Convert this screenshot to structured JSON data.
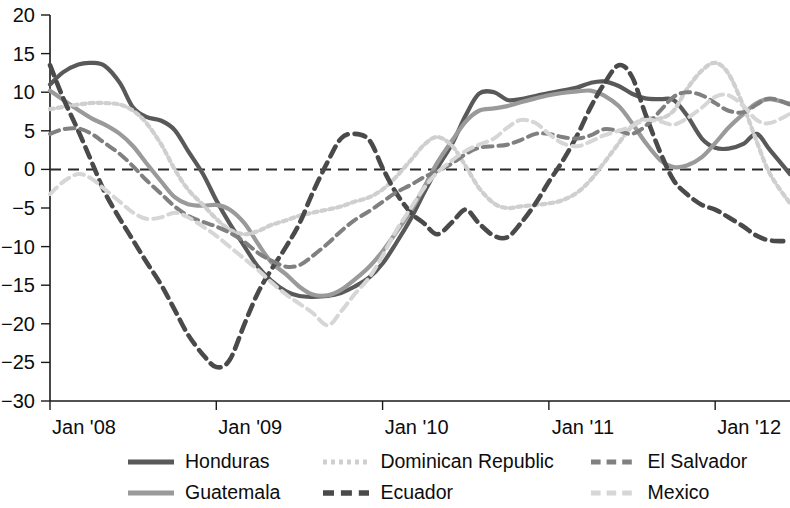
{
  "chart_data": {
    "type": "line",
    "title": "",
    "subtitle": "",
    "xlabel": "",
    "ylabel": "",
    "xlim": [
      2008.0,
      2012.45
    ],
    "ylim": [
      -30,
      20
    ],
    "x_tick_labels": [
      "Jan '08",
      "Jan '09",
      "Jan '10",
      "Jan '11",
      "Jan '12"
    ],
    "x_tick_values": [
      2008,
      2009,
      2010,
      2011,
      2012
    ],
    "y_tick_labels": [
      "20",
      "15",
      "10",
      "5",
      "0",
      "-5",
      "-10",
      "-15",
      "-20",
      "-25",
      "-30"
    ],
    "y_tick_values": [
      20,
      15,
      10,
      5,
      0,
      -5,
      -10,
      -15,
      -20,
      -25,
      -30
    ],
    "grid": false,
    "zero_reference_line": 0,
    "legend_position": "bottom",
    "series": [
      {
        "name": "Honduras",
        "color": "#595959",
        "style": "solid",
        "width": 4.2,
        "x": [
          2008.0,
          2008.08,
          2008.17,
          2008.25,
          2008.33,
          2008.42,
          2008.5,
          2008.58,
          2008.67,
          2008.75,
          2008.83,
          2008.92,
          2009.0,
          2009.08,
          2009.17,
          2009.25,
          2009.33,
          2009.42,
          2009.5,
          2009.58,
          2009.67,
          2009.75,
          2009.83,
          2009.92,
          2010.0,
          2010.08,
          2010.17,
          2010.25,
          2010.33,
          2010.42,
          2010.5,
          2010.58,
          2010.67,
          2010.75,
          2010.83,
          2010.92,
          2011.0,
          2011.08,
          2011.17,
          2011.25,
          2011.33,
          2011.42,
          2011.5,
          2011.58,
          2011.67,
          2011.75,
          2011.83,
          2011.92,
          2012.0,
          2012.08,
          2012.17,
          2012.25,
          2012.33,
          2012.45
        ],
        "values": [
          11.0,
          12.6,
          13.6,
          13.8,
          13.4,
          11.2,
          8.0,
          6.8,
          6.3,
          5.1,
          2.4,
          -0.6,
          -4.0,
          -7.0,
          -10.0,
          -12.6,
          -14.4,
          -15.8,
          -16.4,
          -16.5,
          -16.4,
          -16.0,
          -15.2,
          -14.0,
          -12.2,
          -9.6,
          -6.4,
          -3.0,
          0.2,
          3.4,
          7.0,
          9.8,
          10.0,
          9.0,
          9.1,
          9.5,
          9.9,
          10.2,
          10.6,
          11.2,
          11.4,
          10.8,
          9.8,
          9.2,
          9.1,
          9.0,
          7.0,
          4.0,
          2.8,
          2.7,
          3.3,
          4.6,
          2.5,
          -0.6
        ]
      },
      {
        "name": "Guatemala",
        "color": "#9a9a9a",
        "style": "solid",
        "width": 4.2,
        "x": [
          2008.0,
          2008.08,
          2008.17,
          2008.25,
          2008.33,
          2008.42,
          2008.5,
          2008.58,
          2008.67,
          2008.75,
          2008.83,
          2008.92,
          2009.0,
          2009.08,
          2009.17,
          2009.25,
          2009.33,
          2009.42,
          2009.5,
          2009.58,
          2009.67,
          2009.75,
          2009.83,
          2009.92,
          2010.0,
          2010.08,
          2010.17,
          2010.25,
          2010.33,
          2010.42,
          2010.5,
          2010.58,
          2010.67,
          2010.75,
          2010.83,
          2010.92,
          2011.0,
          2011.08,
          2011.17,
          2011.25,
          2011.33,
          2011.42,
          2011.5,
          2011.58,
          2011.67,
          2011.75,
          2011.83,
          2011.92,
          2012.0,
          2012.08,
          2012.17,
          2012.25,
          2012.33,
          2012.45
        ],
        "values": [
          10.2,
          9.0,
          7.7,
          6.6,
          5.8,
          4.6,
          3.0,
          0.8,
          -1.6,
          -3.6,
          -4.5,
          -4.7,
          -4.6,
          -5.2,
          -7.0,
          -9.6,
          -12.0,
          -13.6,
          -15.2,
          -16.2,
          -16.3,
          -15.6,
          -14.3,
          -12.6,
          -10.6,
          -8.2,
          -5.4,
          -2.3,
          0.9,
          3.8,
          6.2,
          7.6,
          7.9,
          8.2,
          8.7,
          9.2,
          9.6,
          9.9,
          10.1,
          10.2,
          9.6,
          8.2,
          6.0,
          3.5,
          1.2,
          0.3,
          0.5,
          1.6,
          3.4,
          5.4,
          7.2,
          8.6,
          9.1,
          8.5
        ]
      },
      {
        "name": "Dominican Republic",
        "color": "#cfcfcf",
        "style": "dotted",
        "width": 4.2,
        "x": [
          2008.0,
          2008.08,
          2008.17,
          2008.25,
          2008.33,
          2008.42,
          2008.5,
          2008.58,
          2008.67,
          2008.75,
          2008.83,
          2008.92,
          2009.0,
          2009.08,
          2009.17,
          2009.25,
          2009.33,
          2009.42,
          2009.5,
          2009.58,
          2009.67,
          2009.75,
          2009.83,
          2009.92,
          2010.0,
          2010.08,
          2010.17,
          2010.25,
          2010.33,
          2010.42,
          2010.5,
          2010.58,
          2010.67,
          2010.75,
          2010.83,
          2010.92,
          2011.0,
          2011.08,
          2011.17,
          2011.25,
          2011.33,
          2011.42,
          2011.5,
          2011.58,
          2011.67,
          2011.75,
          2011.83,
          2011.92,
          2012.0,
          2012.08,
          2012.17,
          2012.25,
          2012.33,
          2012.45
        ],
        "values": [
          7.8,
          8.1,
          8.4,
          8.6,
          8.6,
          8.4,
          7.6,
          6.0,
          3.2,
          0.0,
          -2.6,
          -4.6,
          -6.4,
          -7.8,
          -8.4,
          -8.0,
          -7.2,
          -6.6,
          -6.0,
          -5.6,
          -5.2,
          -4.8,
          -4.2,
          -3.6,
          -2.6,
          -1.0,
          1.2,
          3.2,
          4.2,
          3.0,
          0.4,
          -2.4,
          -4.4,
          -5.0,
          -4.8,
          -4.6,
          -4.4,
          -4.0,
          -3.0,
          -1.4,
          0.8,
          3.4,
          5.6,
          6.6,
          6.6,
          7.6,
          10.4,
          12.8,
          13.8,
          12.4,
          8.2,
          3.6,
          -0.6,
          -4.4
        ]
      },
      {
        "name": "Ecuador",
        "color": "#4a4a4a",
        "style": "dashed",
        "width": 4.6,
        "x": [
          2008.0,
          2008.08,
          2008.17,
          2008.25,
          2008.33,
          2008.42,
          2008.5,
          2008.58,
          2008.67,
          2008.75,
          2008.83,
          2008.92,
          2009.0,
          2009.08,
          2009.17,
          2009.25,
          2009.33,
          2009.42,
          2009.5,
          2009.58,
          2009.67,
          2009.75,
          2009.83,
          2009.92,
          2010.0,
          2010.08,
          2010.17,
          2010.25,
          2010.33,
          2010.42,
          2010.5,
          2010.58,
          2010.67,
          2010.75,
          2010.83,
          2010.92,
          2011.0,
          2011.08,
          2011.17,
          2011.25,
          2011.33,
          2011.42,
          2011.5,
          2011.58,
          2011.67,
          2011.75,
          2011.83,
          2011.92,
          2012.0,
          2012.08,
          2012.17,
          2012.25,
          2012.33,
          2012.45
        ],
        "values": [
          13.5,
          9.2,
          5.0,
          1.0,
          -3.0,
          -6.4,
          -9.2,
          -12.0,
          -15.0,
          -18.2,
          -21.4,
          -24.0,
          -25.6,
          -24.7,
          -20.0,
          -16.0,
          -13.0,
          -10.0,
          -7.0,
          -3.0,
          1.0,
          4.0,
          4.6,
          3.8,
          0.2,
          -3.0,
          -5.6,
          -7.0,
          -8.4,
          -6.8,
          -5.2,
          -7.0,
          -8.6,
          -8.8,
          -7.0,
          -4.4,
          -1.6,
          1.0,
          4.4,
          8.0,
          11.0,
          13.5,
          12.0,
          7.2,
          2.2,
          -1.4,
          -3.2,
          -4.6,
          -5.2,
          -6.2,
          -7.4,
          -8.6,
          -9.2,
          -9.3
        ]
      },
      {
        "name": "El Salvador",
        "color": "#808080",
        "style": "dashed",
        "width": 4.0,
        "x": [
          2008.0,
          2008.08,
          2008.17,
          2008.25,
          2008.33,
          2008.42,
          2008.5,
          2008.58,
          2008.67,
          2008.75,
          2008.83,
          2008.92,
          2009.0,
          2009.08,
          2009.17,
          2009.25,
          2009.33,
          2009.42,
          2009.5,
          2009.58,
          2009.67,
          2009.75,
          2009.83,
          2009.92,
          2010.0,
          2010.08,
          2010.17,
          2010.25,
          2010.33,
          2010.42,
          2010.5,
          2010.58,
          2010.67,
          2010.75,
          2010.83,
          2010.92,
          2011.0,
          2011.08,
          2011.17,
          2011.25,
          2011.33,
          2011.42,
          2011.5,
          2011.58,
          2011.67,
          2011.75,
          2011.83,
          2011.92,
          2012.0,
          2012.08,
          2012.17,
          2012.25,
          2012.33,
          2012.45
        ],
        "values": [
          4.6,
          5.2,
          5.3,
          4.6,
          3.4,
          2.0,
          0.4,
          -1.4,
          -3.2,
          -4.8,
          -6.0,
          -6.8,
          -7.4,
          -8.2,
          -9.4,
          -10.8,
          -11.8,
          -12.6,
          -12.4,
          -11.2,
          -9.6,
          -8.0,
          -6.6,
          -5.4,
          -4.2,
          -3.0,
          -2.0,
          -1.0,
          -0.2,
          0.8,
          2.0,
          2.8,
          3.0,
          3.2,
          3.8,
          4.6,
          4.6,
          4.2,
          4.0,
          4.4,
          5.2,
          5.0,
          4.6,
          5.6,
          7.6,
          9.4,
          10.0,
          9.6,
          8.6,
          7.6,
          7.4,
          8.4,
          9.2,
          8.4
        ]
      },
      {
        "name": "Mexico",
        "color": "#d6d6d6",
        "style": "dashed",
        "width": 4.0,
        "x": [
          2008.0,
          2008.08,
          2008.17,
          2008.25,
          2008.33,
          2008.42,
          2008.5,
          2008.58,
          2008.67,
          2008.75,
          2008.83,
          2008.92,
          2009.0,
          2009.08,
          2009.17,
          2009.25,
          2009.33,
          2009.42,
          2009.5,
          2009.58,
          2009.67,
          2009.75,
          2009.83,
          2009.92,
          2010.0,
          2010.08,
          2010.17,
          2010.25,
          2010.33,
          2010.42,
          2010.5,
          2010.58,
          2010.67,
          2010.75,
          2010.83,
          2010.92,
          2011.0,
          2011.08,
          2011.17,
          2011.25,
          2011.33,
          2011.42,
          2011.5,
          2011.58,
          2011.67,
          2011.75,
          2011.83,
          2011.92,
          2012.0,
          2012.08,
          2012.17,
          2012.25,
          2012.33,
          2012.45
        ],
        "values": [
          -3.2,
          -1.6,
          -0.6,
          -1.2,
          -2.6,
          -4.2,
          -5.6,
          -6.4,
          -6.2,
          -5.6,
          -6.2,
          -7.4,
          -8.6,
          -10.0,
          -11.6,
          -13.0,
          -14.6,
          -16.2,
          -17.4,
          -18.6,
          -20.2,
          -18.4,
          -16.2,
          -14.0,
          -11.2,
          -8.0,
          -5.0,
          -2.4,
          -0.4,
          1.2,
          2.4,
          3.2,
          4.0,
          5.4,
          6.4,
          6.0,
          4.6,
          3.4,
          3.0,
          3.6,
          4.4,
          5.0,
          5.6,
          6.4,
          6.2,
          5.8,
          6.6,
          8.0,
          9.4,
          9.6,
          8.2,
          6.4,
          6.0,
          7.2
        ]
      }
    ]
  },
  "legend": {
    "entries": [
      {
        "label": "Honduras",
        "series": "Honduras"
      },
      {
        "label": "Dominican Republic",
        "series": "Dominican Republic"
      },
      {
        "label": "El Salvador",
        "series": "El Salvador"
      },
      {
        "label": "Guatemala",
        "series": "Guatemala"
      },
      {
        "label": "Ecuador",
        "series": "Ecuador"
      },
      {
        "label": "Mexico",
        "series": "Mexico"
      }
    ]
  }
}
